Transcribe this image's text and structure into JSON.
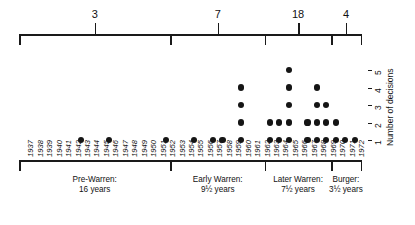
{
  "chart_data": {
    "type": "scatter",
    "title": "",
    "xlabel": "",
    "ylabel": "Number of decisions",
    "ylim": [
      0,
      5
    ],
    "yticks": [
      "1",
      "2",
      "3",
      "4",
      "5"
    ],
    "grid": false,
    "legend": "none",
    "x": [
      "1937",
      "1938",
      "1939",
      "1940",
      "1941",
      "1942",
      "1943",
      "1944",
      "1945",
      "1946",
      "1947",
      "1948",
      "1949",
      "1950",
      "1951",
      "1952",
      "1953",
      "1954",
      "1955",
      "1956",
      "1957",
      "1958",
      "1959",
      "1960",
      "1961",
      "1962",
      "1963",
      "1964",
      "1965",
      "1966",
      "1967",
      "1968",
      "1969",
      "1970",
      "1971",
      "1972"
    ],
    "values": [
      0,
      0,
      0,
      0,
      0,
      0,
      1,
      0,
      0,
      1,
      0,
      0,
      0,
      0,
      0,
      1,
      0,
      0,
      1,
      0,
      1,
      1,
      0,
      4,
      0,
      0,
      2,
      2,
      5,
      0,
      2,
      4,
      3,
      2,
      1,
      1
    ],
    "annotations": [
      "Era totals shown in top bracket: 3, 7, 18, 4"
    ]
  },
  "top_bracket": {
    "segment_counts": [
      "3",
      "7",
      "18",
      "4"
    ],
    "segments": [
      {
        "label": "3",
        "era": "Pre-Warren"
      },
      {
        "label": "7",
        "era": "Early Warren"
      },
      {
        "label": "18",
        "era": "Later Warren"
      },
      {
        "label": "4",
        "era": "Burger"
      }
    ]
  },
  "y_axis": {
    "title": "Number of decisions",
    "ticks": [
      "1",
      "2",
      "3",
      "4",
      "5"
    ]
  },
  "x_axis": {
    "years": [
      "1937",
      "1938",
      "1939",
      "1940",
      "1941",
      "1942",
      "1943",
      "1944",
      "1945",
      "1946",
      "1947",
      "1948",
      "1949",
      "1950",
      "1951",
      "1952",
      "1953",
      "1954",
      "1955",
      "1956",
      "1957",
      "1958",
      "1959",
      "1960",
      "1961",
      "1962",
      "1963",
      "1964",
      "1965",
      "1966",
      "1967",
      "1968",
      "1969",
      "1970",
      "1971",
      "1972"
    ]
  },
  "eras": [
    {
      "name": "Pre-Warren:",
      "duration": "16 years",
      "count": "3"
    },
    {
      "name": "Early Warren:",
      "duration": "9½ years",
      "count": "7"
    },
    {
      "name": "Later Warren:",
      "duration": "7½ years",
      "count": "18"
    },
    {
      "name": "Burger:",
      "duration": "3½ years",
      "count": "4"
    }
  ],
  "colors": {
    "ink": "#151515",
    "background": "#ffffff"
  }
}
